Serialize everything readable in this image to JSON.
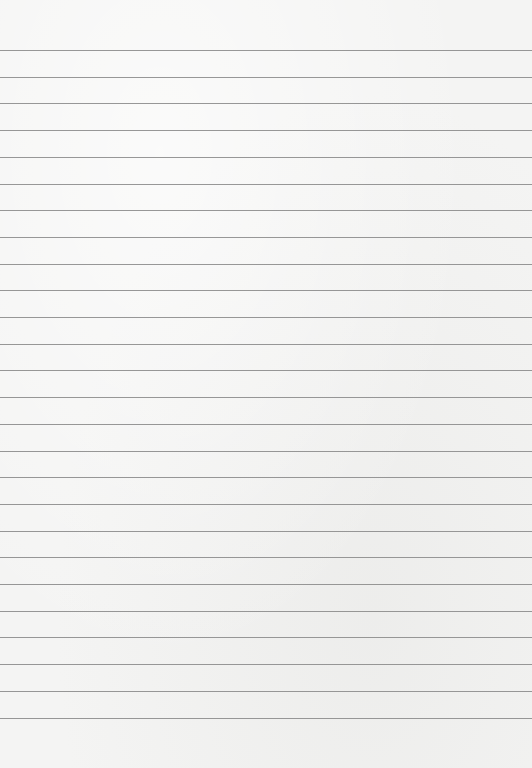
{
  "paper": {
    "background_color": "#f4f4f3",
    "line_color": "#8c8c8c",
    "line_count": 26,
    "first_line_y": 50,
    "line_spacing": 26.7
  }
}
